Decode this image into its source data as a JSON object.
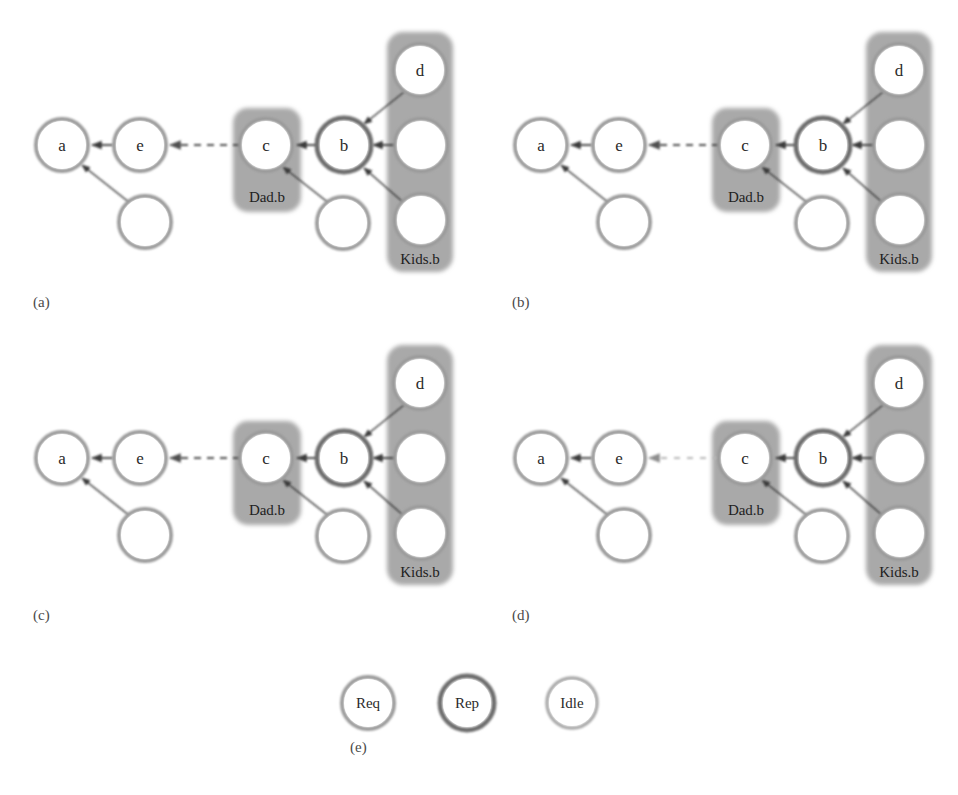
{
  "figure": {
    "title": "",
    "background_color": "#ffffff",
    "width": 958,
    "height": 795,
    "colors": {
      "node_fill": "#ffffff",
      "node_stroke_req": "#9a9a9a",
      "node_stroke_rep": "#6e6e6e",
      "node_stroke_idle": "#a8a8a8",
      "group_box_fill": "#a9a9a9",
      "arrow_solid": "#3a3a3a",
      "arrow_dashed": "#5a5a5a",
      "arrow_dashed_faint": "#b8b8b8",
      "text": "#2b2b2b",
      "panel_label": "#4a4a4a"
    }
  },
  "panels": [
    {
      "id": "a",
      "label": "(a)",
      "groups": [
        {
          "name": "dad-group",
          "label": "Dad.b"
        },
        {
          "name": "kids-group",
          "label": "Kids.b"
        }
      ],
      "nodes": [
        {
          "id": "a",
          "label": "a",
          "type": "Req"
        },
        {
          "id": "e",
          "label": "e",
          "type": "Req"
        },
        {
          "id": "c",
          "label": "c",
          "type": "Req"
        },
        {
          "id": "b",
          "label": "b",
          "type": "Rep"
        },
        {
          "id": "d",
          "label": "d",
          "type": "Req"
        },
        {
          "id": "a_child",
          "label": "",
          "type": "Req"
        },
        {
          "id": "c_child",
          "label": "",
          "type": "Req"
        },
        {
          "id": "kid_mid",
          "label": "",
          "type": "Req"
        },
        {
          "id": "kid_bot",
          "label": "",
          "type": "Req"
        }
      ],
      "edges": [
        {
          "from": "e",
          "to": "a",
          "style": "solid"
        },
        {
          "from": "a_child",
          "to": "a",
          "style": "solid"
        },
        {
          "from": "c",
          "to": "e",
          "style": "dashed"
        },
        {
          "from": "b",
          "to": "c",
          "style": "solid"
        },
        {
          "from": "c_child",
          "to": "c",
          "style": "solid"
        },
        {
          "from": "d",
          "to": "b",
          "style": "solid"
        },
        {
          "from": "kid_mid",
          "to": "b",
          "style": "solid"
        },
        {
          "from": "kid_bot",
          "to": "b",
          "style": "solid"
        }
      ]
    },
    {
      "id": "b",
      "label": "(b)",
      "groups": [
        {
          "name": "dad-group",
          "label": "Dad.b"
        },
        {
          "name": "kids-group",
          "label": "Kids.b"
        }
      ],
      "nodes": [
        {
          "id": "a",
          "label": "a",
          "type": "Req"
        },
        {
          "id": "e",
          "label": "e",
          "type": "Req"
        },
        {
          "id": "c",
          "label": "c",
          "type": "Req"
        },
        {
          "id": "b",
          "label": "b",
          "type": "Rep"
        },
        {
          "id": "d",
          "label": "d",
          "type": "Req"
        },
        {
          "id": "a_child",
          "label": "",
          "type": "Req"
        },
        {
          "id": "c_child",
          "label": "",
          "type": "Req"
        },
        {
          "id": "kid_mid",
          "label": "",
          "type": "Req"
        },
        {
          "id": "kid_bot",
          "label": "",
          "type": "Req"
        }
      ],
      "edges": [
        {
          "from": "e",
          "to": "a",
          "style": "solid"
        },
        {
          "from": "a_child",
          "to": "a",
          "style": "solid"
        },
        {
          "from": "c",
          "to": "e",
          "style": "dashed"
        },
        {
          "from": "b",
          "to": "c",
          "style": "solid"
        },
        {
          "from": "c_child",
          "to": "c",
          "style": "solid"
        },
        {
          "from": "d",
          "to": "b",
          "style": "solid"
        },
        {
          "from": "kid_mid",
          "to": "b",
          "style": "solid"
        },
        {
          "from": "kid_bot",
          "to": "b",
          "style": "solid"
        }
      ]
    },
    {
      "id": "c",
      "label": "(c)",
      "groups": [
        {
          "name": "dad-group",
          "label": "Dad.b"
        },
        {
          "name": "kids-group",
          "label": "Kids.b"
        }
      ],
      "nodes": [
        {
          "id": "a",
          "label": "a",
          "type": "Req"
        },
        {
          "id": "e",
          "label": "e",
          "type": "Req"
        },
        {
          "id": "c",
          "label": "c",
          "type": "Req"
        },
        {
          "id": "b",
          "label": "b",
          "type": "Rep"
        },
        {
          "id": "d",
          "label": "d",
          "type": "Req"
        },
        {
          "id": "a_child",
          "label": "",
          "type": "Req"
        },
        {
          "id": "c_child",
          "label": "",
          "type": "Req"
        },
        {
          "id": "kid_mid",
          "label": "",
          "type": "Req"
        },
        {
          "id": "kid_bot",
          "label": "",
          "type": "Req"
        }
      ],
      "edges": [
        {
          "from": "e",
          "to": "a",
          "style": "solid"
        },
        {
          "from": "a_child",
          "to": "a",
          "style": "solid"
        },
        {
          "from": "c",
          "to": "e",
          "style": "dashed"
        },
        {
          "from": "b",
          "to": "c",
          "style": "solid"
        },
        {
          "from": "c_child",
          "to": "c",
          "style": "solid"
        },
        {
          "from": "d",
          "to": "b",
          "style": "solid"
        },
        {
          "from": "kid_mid",
          "to": "b",
          "style": "solid"
        },
        {
          "from": "kid_bot",
          "to": "b",
          "style": "solid"
        }
      ]
    },
    {
      "id": "d",
      "label": "(d)",
      "groups": [
        {
          "name": "dad-group",
          "label": "Dad.b"
        },
        {
          "name": "kids-group",
          "label": "Kids.b"
        }
      ],
      "nodes": [
        {
          "id": "a",
          "label": "a",
          "type": "Req"
        },
        {
          "id": "e",
          "label": "e",
          "type": "Req"
        },
        {
          "id": "c",
          "label": "c",
          "type": "Req"
        },
        {
          "id": "b",
          "label": "b",
          "type": "Rep"
        },
        {
          "id": "d",
          "label": "d",
          "type": "Req"
        },
        {
          "id": "a_child",
          "label": "",
          "type": "Req"
        },
        {
          "id": "c_child",
          "label": "",
          "type": "Req"
        },
        {
          "id": "kid_mid",
          "label": "",
          "type": "Req"
        },
        {
          "id": "kid_bot",
          "label": "",
          "type": "Req"
        }
      ],
      "edges": [
        {
          "from": "e",
          "to": "a",
          "style": "solid"
        },
        {
          "from": "a_child",
          "to": "a",
          "style": "solid"
        },
        {
          "from": "c",
          "to": "e",
          "style": "dashed-faint"
        },
        {
          "from": "b",
          "to": "c",
          "style": "solid"
        },
        {
          "from": "c_child",
          "to": "c",
          "style": "solid"
        },
        {
          "from": "d",
          "to": "b",
          "style": "solid"
        },
        {
          "from": "kid_mid",
          "to": "b",
          "style": "solid"
        },
        {
          "from": "kid_bot",
          "to": "b",
          "style": "solid"
        }
      ]
    }
  ],
  "legend": {
    "label": "(e)",
    "items": [
      {
        "id": "req",
        "label": "Req",
        "type": "Req"
      },
      {
        "id": "rep",
        "label": "Rep",
        "type": "Rep"
      },
      {
        "id": "idle",
        "label": "Idle",
        "type": "Idle"
      }
    ]
  }
}
